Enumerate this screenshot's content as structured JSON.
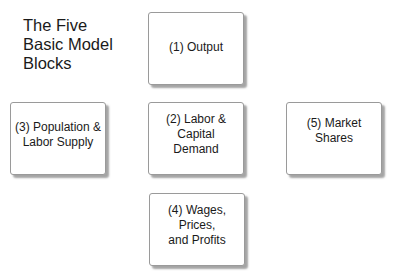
{
  "title": "The Five\nBasic Model\nBlocks",
  "blocks": {
    "output": {
      "label": "(1) Output"
    },
    "labor_capital": {
      "label": "(2) Labor & Capital\nDemand"
    },
    "population": {
      "label": "(3) Population &\nLabor Supply"
    },
    "wages": {
      "label": "(4) Wages, Prices,\nand Profits"
    },
    "market_shares": {
      "label": "(5) Market Shares"
    }
  },
  "colors": {
    "background": "#ffffff",
    "box_border": "#9a9a9a",
    "box_shadow": "#5a5a5a",
    "text": "#1a1a1a"
  }
}
